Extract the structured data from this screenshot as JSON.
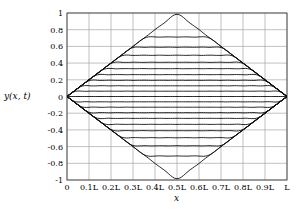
{
  "chart_data": {
    "type": "line",
    "title": "",
    "xlabel": "x",
    "ylabel": "y(x, t)",
    "xticks": [
      "0",
      "0.1L",
      "0.2L",
      "0.3L",
      "0.4L",
      "0.5L",
      "0.6L",
      "0.7L",
      "0.8L",
      "0.9L",
      "L"
    ],
    "yticks": [
      "-1",
      "-0.8",
      "-0.6",
      "-0.4",
      "-0.2",
      "0",
      "0.2",
      "0.4",
      "0.6",
      "0.8",
      "1"
    ],
    "xlim": [
      0,
      1
    ],
    "ylim": [
      -1,
      1
    ],
    "grid": true,
    "series_amplitudes": [
      1,
      0.9,
      0.8,
      0.7,
      0.6,
      0.5,
      0.4,
      0.3,
      0.2,
      0.1,
      0,
      -0.1,
      -0.2,
      -0.3,
      -0.4,
      -0.5,
      -0.6,
      -0.7,
      -0.8,
      -0.9,
      -1
    ]
  }
}
